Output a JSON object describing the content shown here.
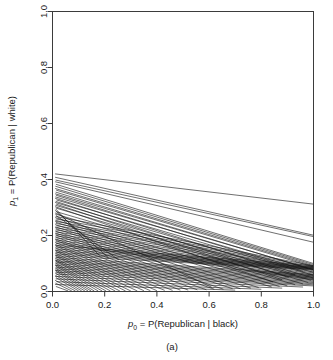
{
  "figure": {
    "caption": "(a)",
    "background": "#ffffff",
    "line_color": "#151515"
  },
  "chart_data": {
    "type": "line",
    "title": "",
    "subtitle": "",
    "xlabel_parts": {
      "symbol": "p",
      "symbol_sub": "0",
      "rest": " = P(Republican | black)"
    },
    "ylabel_parts": {
      "symbol": "p",
      "symbol_sub": "1",
      "rest": " = P(Republican | white)"
    },
    "xlabel": "p0 = P(Republican | black)",
    "ylabel": "p1 = P(Republican | white)",
    "xlim": [
      0.0,
      1.0
    ],
    "ylim": [
      0.0,
      1.0
    ],
    "xticks": [
      0.0,
      0.2,
      0.4,
      0.6,
      0.8,
      1.0
    ],
    "yticks": [
      0.0,
      0.2,
      0.4,
      0.6,
      0.8,
      1.0
    ],
    "xticklabels": [
      "0.0",
      "0.2",
      "0.4",
      "0.6",
      "0.8",
      "1.0"
    ],
    "yticklabels": [
      "0.0",
      "0.2",
      "0.4",
      "0.6",
      "0.8",
      "1.0"
    ],
    "grid": false,
    "legend": "none",
    "annotation": "(a)",
    "n_lines": 98,
    "series": [
      {
        "name": "line-1",
        "x": [
          0.01,
          1.0
        ],
        "y": [
          0.42,
          0.312
        ]
      },
      {
        "name": "line-2",
        "x": [
          0.01,
          1.0
        ],
        "y": [
          0.408,
          0.201
        ]
      },
      {
        "name": "line-3",
        "x": [
          0.012,
          1.0
        ],
        "y": [
          0.398,
          0.196
        ]
      },
      {
        "name": "line-4",
        "x": [
          0.01,
          1.0
        ],
        "y": [
          0.392,
          0.176
        ]
      },
      {
        "name": "line-5",
        "x": [
          0.013,
          1.0
        ],
        "y": [
          0.383,
          0.1
        ]
      },
      {
        "name": "line-6",
        "x": [
          0.011,
          1.0
        ],
        "y": [
          0.376,
          0.096
        ]
      },
      {
        "name": "line-7",
        "x": [
          0.01,
          1.0
        ],
        "y": [
          0.368,
          0.092
        ]
      },
      {
        "name": "line-8",
        "x": [
          0.014,
          1.0
        ],
        "y": [
          0.362,
          0.088
        ]
      },
      {
        "name": "line-9",
        "x": [
          0.012,
          0.98
        ],
        "y": [
          0.355,
          0.082
        ]
      },
      {
        "name": "line-10",
        "x": [
          0.01,
          1.0
        ],
        "y": [
          0.349,
          0.078
        ]
      },
      {
        "name": "line-11",
        "x": [
          0.013,
          0.96
        ],
        "y": [
          0.344,
          0.072
        ]
      },
      {
        "name": "line-12",
        "x": [
          0.011,
          1.0
        ],
        "y": [
          0.338,
          0.068
        ]
      },
      {
        "name": "line-13",
        "x": [
          0.01,
          0.93
        ],
        "y": [
          0.333,
          0.06
        ]
      },
      {
        "name": "line-14",
        "x": [
          0.015,
          1.0
        ],
        "y": [
          0.327,
          0.058
        ]
      },
      {
        "name": "line-15",
        "x": [
          0.012,
          0.905
        ],
        "y": [
          0.322,
          0.05
        ]
      },
      {
        "name": "line-16",
        "x": [
          0.01,
          1.0
        ],
        "y": [
          0.318,
          0.048
        ]
      },
      {
        "name": "line-17",
        "x": [
          0.014,
          0.88
        ],
        "y": [
          0.312,
          0.042
        ]
      },
      {
        "name": "line-18",
        "x": [
          0.011,
          0.99
        ],
        "y": [
          0.308,
          0.04
        ]
      },
      {
        "name": "line-19",
        "x": [
          0.01,
          0.845
        ],
        "y": [
          0.303,
          0.034
        ]
      },
      {
        "name": "line-20",
        "x": [
          0.013,
          0.98
        ],
        "y": [
          0.298,
          0.032
        ]
      },
      {
        "name": "line-21",
        "x": [
          0.012,
          0.18
        ],
        "y": [
          0.295,
          0.128
        ]
      },
      {
        "name": "line-22",
        "x": [
          0.01,
          0.215
        ],
        "y": [
          0.29,
          0.12
        ]
      },
      {
        "name": "line-23",
        "x": [
          0.015,
          0.96
        ],
        "y": [
          0.285,
          0.027
        ]
      },
      {
        "name": "line-24",
        "x": [
          0.011,
          0.61
        ],
        "y": [
          0.281,
          0.015
        ]
      },
      {
        "name": "line-25",
        "x": [
          0.01,
          0.93
        ],
        "y": [
          0.277,
          0.024
        ]
      },
      {
        "name": "line-26",
        "x": [
          0.013,
          0.255
        ],
        "y": [
          0.272,
          0.112
        ]
      },
      {
        "name": "line-27",
        "x": [
          0.012,
          1.0
        ],
        "y": [
          0.268,
          0.092
        ]
      },
      {
        "name": "line-28",
        "x": [
          0.01,
          0.9
        ],
        "y": [
          0.264,
          0.02
        ]
      },
      {
        "name": "line-29",
        "x": [
          0.014,
          1.0
        ],
        "y": [
          0.259,
          0.088
        ]
      },
      {
        "name": "line-30",
        "x": [
          0.011,
          0.87
        ],
        "y": [
          0.255,
          0.018
        ]
      },
      {
        "name": "line-31",
        "x": [
          0.01,
          1.0
        ],
        "y": [
          0.251,
          0.084
        ]
      },
      {
        "name": "line-32",
        "x": [
          0.013,
          0.84
        ],
        "y": [
          0.247,
          0.016
        ]
      },
      {
        "name": "line-33",
        "x": [
          0.012,
          1.0
        ],
        "y": [
          0.243,
          0.08
        ]
      },
      {
        "name": "line-34",
        "x": [
          0.01,
          0.79
        ],
        "y": [
          0.239,
          0.014
        ]
      },
      {
        "name": "line-35",
        "x": [
          0.015,
          1.0
        ],
        "y": [
          0.235,
          0.078
        ]
      },
      {
        "name": "line-36",
        "x": [
          0.011,
          0.76
        ],
        "y": [
          0.231,
          0.012
        ]
      },
      {
        "name": "line-37",
        "x": [
          0.01,
          1.0
        ],
        "y": [
          0.228,
          0.074
        ]
      },
      {
        "name": "line-38",
        "x": [
          0.013,
          0.72
        ],
        "y": [
          0.224,
          0.01
        ]
      },
      {
        "name": "line-39",
        "x": [
          0.012,
          1.0
        ],
        "y": [
          0.22,
          0.07
        ]
      },
      {
        "name": "line-40",
        "x": [
          0.01,
          0.69
        ],
        "y": [
          0.216,
          0.01
        ]
      },
      {
        "name": "line-41",
        "x": [
          0.014,
          1.0
        ],
        "y": [
          0.213,
          0.066
        ]
      },
      {
        "name": "line-42",
        "x": [
          0.011,
          0.655
        ],
        "y": [
          0.209,
          0.008
        ]
      },
      {
        "name": "line-43",
        "x": [
          0.01,
          1.0
        ],
        "y": [
          0.206,
          0.062
        ]
      },
      {
        "name": "line-44",
        "x": [
          0.013,
          0.62
        ],
        "y": [
          0.202,
          0.008
        ]
      },
      {
        "name": "line-45",
        "x": [
          0.012,
          1.0
        ],
        "y": [
          0.199,
          0.058
        ]
      },
      {
        "name": "line-46",
        "x": [
          0.01,
          0.59
        ],
        "y": [
          0.195,
          0.006
        ]
      },
      {
        "name": "line-47",
        "x": [
          0.015,
          1.0
        ],
        "y": [
          0.192,
          0.054
        ]
      },
      {
        "name": "line-48",
        "x": [
          0.011,
          0.555
        ],
        "y": [
          0.188,
          0.006
        ]
      },
      {
        "name": "line-49",
        "x": [
          0.01,
          1.0
        ],
        "y": [
          0.185,
          0.05
        ]
      },
      {
        "name": "line-50",
        "x": [
          0.013,
          0.52
        ],
        "y": [
          0.182,
          0.005
        ]
      },
      {
        "name": "line-51",
        "x": [
          0.012,
          1.0
        ],
        "y": [
          0.178,
          0.046
        ]
      },
      {
        "name": "line-52",
        "x": [
          0.01,
          0.49
        ],
        "y": [
          0.175,
          0.005
        ]
      },
      {
        "name": "line-53",
        "x": [
          0.014,
          1.0
        ],
        "y": [
          0.172,
          0.042
        ]
      },
      {
        "name": "line-54",
        "x": [
          0.011,
          0.46
        ],
        "y": [
          0.168,
          0.004
        ]
      },
      {
        "name": "line-55",
        "x": [
          0.01,
          1.0
        ],
        "y": [
          0.165,
          0.092
        ]
      },
      {
        "name": "line-56",
        "x": [
          0.013,
          0.43
        ],
        "y": [
          0.162,
          0.004
        ]
      },
      {
        "name": "line-57",
        "x": [
          0.012,
          1.0
        ],
        "y": [
          0.159,
          0.088
        ]
      },
      {
        "name": "line-58",
        "x": [
          0.01,
          0.4
        ],
        "y": [
          0.156,
          0.003
        ]
      },
      {
        "name": "line-59",
        "x": [
          0.015,
          1.0
        ],
        "y": [
          0.152,
          0.086
        ]
      },
      {
        "name": "line-60",
        "x": [
          0.011,
          0.375
        ],
        "y": [
          0.149,
          0.003
        ]
      },
      {
        "name": "line-61",
        "x": [
          0.01,
          1.0
        ],
        "y": [
          0.146,
          0.084
        ]
      },
      {
        "name": "line-62",
        "x": [
          0.013,
          0.35
        ],
        "y": [
          0.143,
          0.003
        ]
      },
      {
        "name": "line-63",
        "x": [
          0.012,
          1.0
        ],
        "y": [
          0.14,
          0.082
        ]
      },
      {
        "name": "line-64",
        "x": [
          0.01,
          0.325
        ],
        "y": [
          0.137,
          0.002
        ]
      },
      {
        "name": "line-65",
        "x": [
          0.014,
          1.0
        ],
        "y": [
          0.134,
          0.08
        ]
      },
      {
        "name": "line-66",
        "x": [
          0.011,
          0.3
        ],
        "y": [
          0.131,
          0.002
        ]
      },
      {
        "name": "line-67",
        "x": [
          0.01,
          1.0
        ],
        "y": [
          0.128,
          0.078
        ]
      },
      {
        "name": "line-68",
        "x": [
          0.013,
          0.28
        ],
        "y": [
          0.125,
          0.002
        ]
      },
      {
        "name": "line-69",
        "x": [
          0.012,
          1.0
        ],
        "y": [
          0.122,
          0.06
        ]
      },
      {
        "name": "line-70",
        "x": [
          0.01,
          0.258
        ],
        "y": [
          0.119,
          0.002
        ]
      },
      {
        "name": "line-71",
        "x": [
          0.015,
          1.0
        ],
        "y": [
          0.116,
          0.056
        ]
      },
      {
        "name": "line-72",
        "x": [
          0.011,
          0.24
        ],
        "y": [
          0.113,
          0.002
        ]
      },
      {
        "name": "line-73",
        "x": [
          0.01,
          1.0
        ],
        "y": [
          0.11,
          0.052
        ]
      },
      {
        "name": "line-74",
        "x": [
          0.013,
          0.222
        ],
        "y": [
          0.108,
          0.002
        ]
      },
      {
        "name": "line-75",
        "x": [
          0.012,
          1.0
        ],
        "y": [
          0.105,
          0.048
        ]
      },
      {
        "name": "line-76",
        "x": [
          0.01,
          0.205
        ],
        "y": [
          0.102,
          0.002
        ]
      },
      {
        "name": "line-77",
        "x": [
          0.014,
          1.0
        ],
        "y": [
          0.099,
          0.044
        ]
      },
      {
        "name": "line-78",
        "x": [
          0.011,
          0.19
        ],
        "y": [
          0.096,
          0.002
        ]
      },
      {
        "name": "line-79",
        "x": [
          0.01,
          1.0
        ],
        "y": [
          0.093,
          0.04
        ]
      },
      {
        "name": "line-80",
        "x": [
          0.013,
          0.175
        ],
        "y": [
          0.09,
          0.002
        ]
      },
      {
        "name": "line-81",
        "x": [
          0.012,
          1.0
        ],
        "y": [
          0.087,
          0.036
        ]
      },
      {
        "name": "line-82",
        "x": [
          0.01,
          0.16
        ],
        "y": [
          0.084,
          0.002
        ]
      },
      {
        "name": "line-83",
        "x": [
          0.015,
          1.0
        ],
        "y": [
          0.081,
          0.032
        ]
      },
      {
        "name": "line-84",
        "x": [
          0.011,
          0.148
        ],
        "y": [
          0.078,
          0.002
        ]
      },
      {
        "name": "line-85",
        "x": [
          0.01,
          1.0
        ],
        "y": [
          0.075,
          0.028
        ]
      },
      {
        "name": "line-86",
        "x": [
          0.013,
          0.136
        ],
        "y": [
          0.072,
          0.002
        ]
      },
      {
        "name": "line-87",
        "x": [
          0.012,
          1.0
        ],
        "y": [
          0.069,
          0.024
        ]
      },
      {
        "name": "line-88",
        "x": [
          0.01,
          0.124
        ],
        "y": [
          0.066,
          0.002
        ]
      },
      {
        "name": "line-89",
        "x": [
          0.014,
          1.0
        ],
        "y": [
          0.062,
          0.02
        ]
      },
      {
        "name": "line-90",
        "x": [
          0.011,
          0.112
        ],
        "y": [
          0.058,
          0.002
        ]
      },
      {
        "name": "line-91",
        "x": [
          0.01,
          0.96
        ],
        "y": [
          0.054,
          0.016
        ]
      },
      {
        "name": "line-92",
        "x": [
          0.013,
          0.1
        ],
        "y": [
          0.05,
          0.002
        ]
      },
      {
        "name": "line-93",
        "x": [
          0.012,
          0.88
        ],
        "y": [
          0.045,
          0.012
        ]
      },
      {
        "name": "line-94",
        "x": [
          0.01,
          0.088
        ],
        "y": [
          0.04,
          0.002
        ]
      },
      {
        "name": "line-95",
        "x": [
          0.015,
          0.8
        ],
        "y": [
          0.035,
          0.008
        ]
      },
      {
        "name": "line-96",
        "x": [
          0.011,
          0.074
        ],
        "y": [
          0.03,
          0.002
        ]
      },
      {
        "name": "line-97",
        "x": [
          0.01,
          0.7
        ],
        "y": [
          0.025,
          0.005
        ]
      },
      {
        "name": "line-98",
        "x": [
          0.013,
          0.06
        ],
        "y": [
          0.018,
          0.002
        ]
      }
    ]
  }
}
